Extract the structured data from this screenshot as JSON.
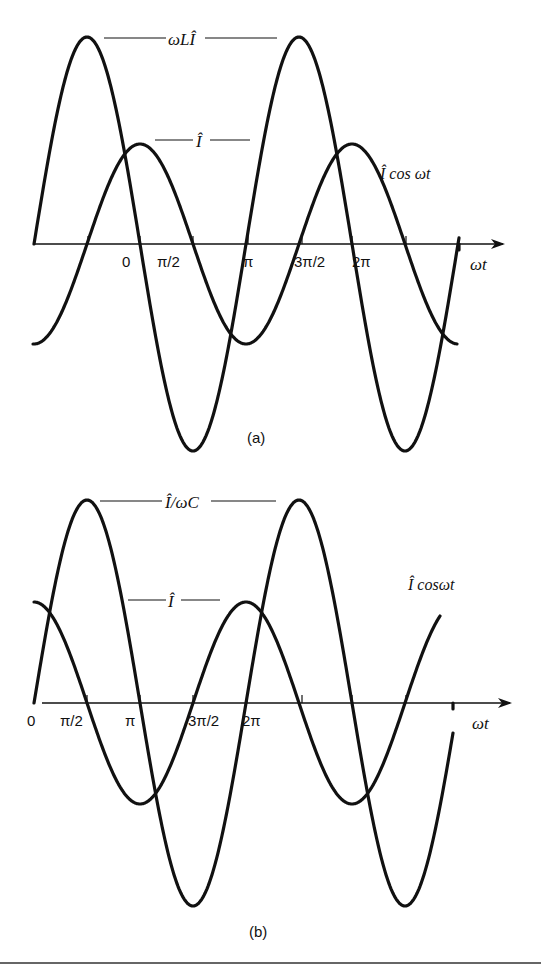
{
  "diagram_a": {
    "caption": "(a)",
    "axis_label": "ωt",
    "tick_labels": [
      "0",
      "π/2",
      "π",
      "3π/2",
      "2π"
    ],
    "labels": {
      "voltage_amplitude": "ωLÎ",
      "current_amplitude": "Î",
      "current_curve": "Î cos ωt"
    },
    "geometry": {
      "axis_y": 244,
      "axis_x_start": 34,
      "axis_x_end": 503,
      "period_px": 212,
      "ticks_x": [
        88,
        140,
        193,
        248,
        302,
        352,
        406
      ],
      "current": {
        "amplitude": 100,
        "phase_x": 140,
        "x_start": 33,
        "x_end": 457,
        "kind": "cos"
      },
      "voltage": {
        "amplitude": 207,
        "phase_x": 34,
        "x_start": 34,
        "x_end": 459,
        "kind": "sin"
      }
    }
  },
  "diagram_b": {
    "caption": "(b)",
    "axis_label": "ωt",
    "tick_labels": [
      "0",
      "π/2",
      "π",
      "3π/2",
      "2π"
    ],
    "labels": {
      "voltage_amplitude": "Î/ωC",
      "current_amplitude": "Î",
      "current_curve": "Î cosωt"
    },
    "geometry": {
      "axis_y": 703,
      "axis_x_start": 42,
      "axis_x_end": 510,
      "period_px": 212,
      "ticks_x": [
        87,
        140,
        193,
        247,
        302,
        352,
        406
      ],
      "current": {
        "amplitude": 101,
        "phase_x": 34,
        "x_start": 34,
        "x_end": 440,
        "kind": "cos"
      },
      "voltage": {
        "amplitude": 203,
        "phase_x": 34,
        "x_start": 34,
        "x_end": 453,
        "kind": "sin"
      }
    }
  },
  "colors": {
    "ink": "#111111",
    "background": "#ffffff"
  }
}
